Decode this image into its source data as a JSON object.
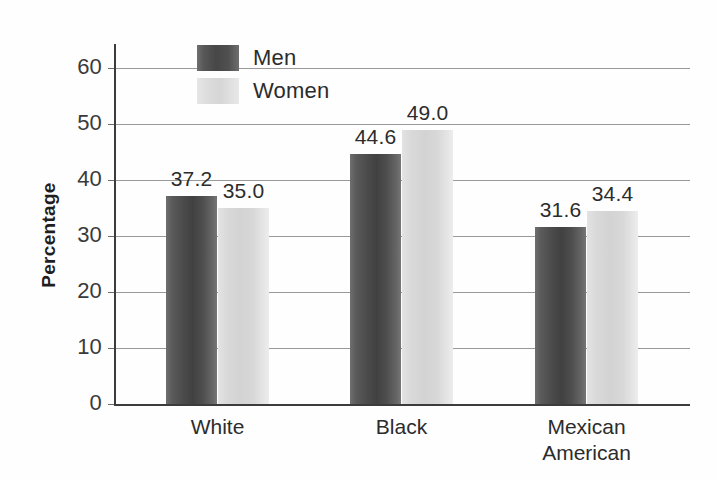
{
  "chart_data": {
    "type": "bar",
    "title": "",
    "xlabel": "",
    "ylabel": "Percentage",
    "ylim": [
      0,
      65
    ],
    "yticks": [
      0,
      10,
      20,
      30,
      40,
      50,
      60
    ],
    "ytick_labels": [
      "0",
      "10",
      "20",
      "30",
      "40",
      "50",
      "60"
    ],
    "grid": true,
    "legend_position": "top-left-inside",
    "categories": [
      "White",
      "Black",
      "Mexican American"
    ],
    "category_lines": [
      [
        "White"
      ],
      [
        "Black"
      ],
      [
        "Mexican",
        "American"
      ]
    ],
    "series": [
      {
        "name": "Men",
        "color": "#4a4a4a",
        "values": [
          37.2,
          44.6,
          31.6
        ],
        "labels": [
          "37.2",
          "44.6",
          "31.6"
        ]
      },
      {
        "name": "Women",
        "color": "#d9d9d9",
        "values": [
          35.0,
          49.0,
          34.4
        ],
        "labels": [
          "35.0",
          "49.0",
          "34.4"
        ]
      }
    ]
  },
  "legend": {
    "items": [
      {
        "label": "Men",
        "swatch": "men"
      },
      {
        "label": "Women",
        "swatch": "women"
      }
    ]
  },
  "axis": {
    "y_title": "Percentage"
  },
  "colors": {
    "background": "#fefefe",
    "axis": "#3c3c3c",
    "gridline": "#9a9a9a",
    "text": "#2c2c2c",
    "men_bar": "#4a4a4a",
    "women_bar": "#d9d9d9"
  }
}
